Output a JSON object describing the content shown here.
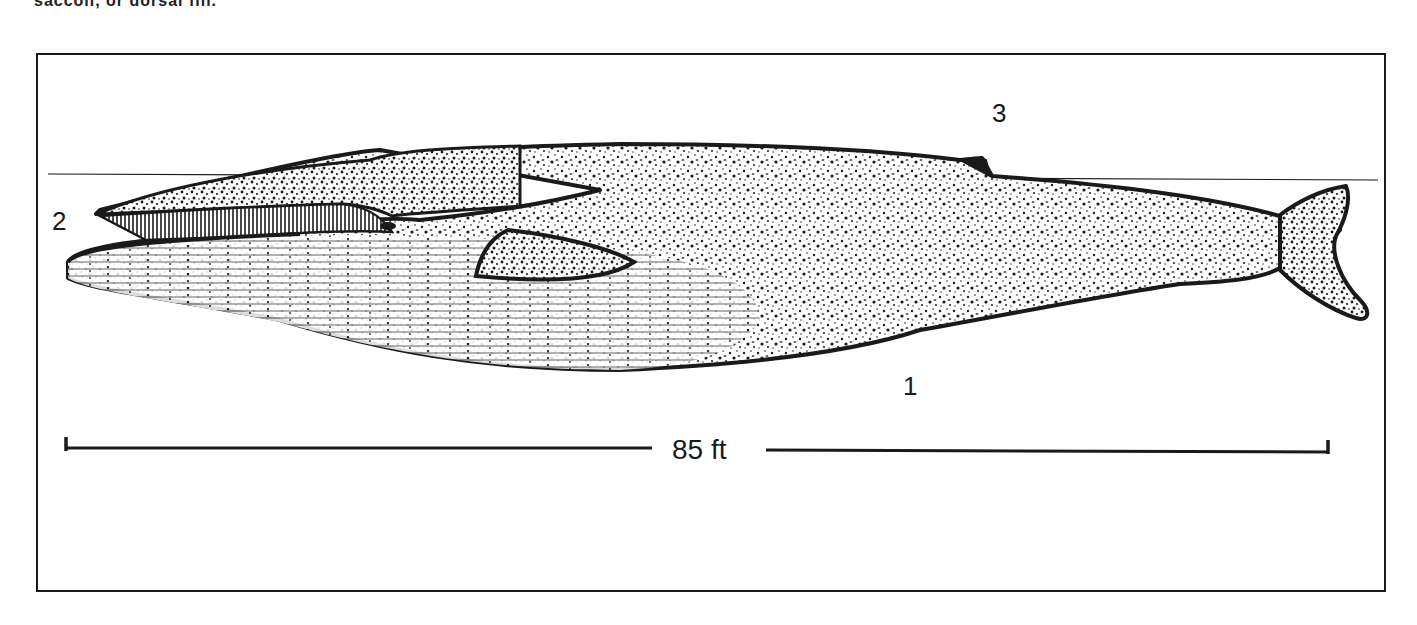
{
  "caption_fragment": "saccon, or dorsal fin.",
  "figure": {
    "labels": [
      {
        "id": "1",
        "text": "1",
        "refers_to": "throat grooves / ventral side"
      },
      {
        "id": "2",
        "text": "2",
        "refers_to": "baleen plates"
      },
      {
        "id": "3",
        "text": "3",
        "refers_to": "dorsal fin"
      }
    ],
    "scale_bar": {
      "label": "85 ft"
    },
    "colors": {
      "ink": "#1a1a1a",
      "paper": "#ffffff"
    }
  }
}
